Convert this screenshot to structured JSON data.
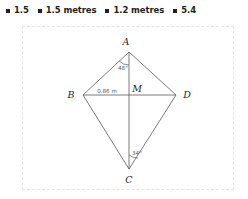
{
  "options": [
    {
      "label": "1.5",
      "bullet": "square-bullet-icon"
    },
    {
      "label": "1.5 metres",
      "bullet": "square-bullet-icon"
    },
    {
      "label": "1.2 metres",
      "bullet": "square-bullet-icon"
    },
    {
      "label": "5.4",
      "bullet": "square-bullet-icon"
    }
  ],
  "figure": {
    "vertices": {
      "a": "A",
      "b": "B",
      "c": "C",
      "d": "D",
      "m": "M"
    },
    "angles": {
      "at_a": "48°",
      "at_c": "34°"
    },
    "measurements": {
      "bm": "0.86 m"
    }
  },
  "colors": {
    "ink": "#231f20",
    "line": "#58585b",
    "border": "#e6e2e4",
    "background": "#ffffff"
  }
}
